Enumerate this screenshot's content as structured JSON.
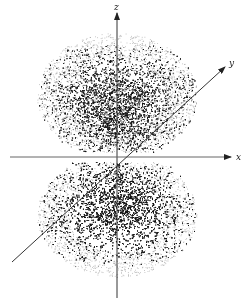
{
  "figure": {
    "axes": {
      "z": {
        "label": "z"
      },
      "y": {
        "label": "y"
      },
      "x": {
        "label": "x"
      }
    },
    "colors": {
      "background": "#ffffff",
      "axis": "#333333",
      "dots": "#111111"
    },
    "lobes": [
      {
        "name": "upper-lobe",
        "center": [
          117,
          95
        ],
        "rx": 80,
        "ry": 62
      },
      {
        "name": "lower-lobe",
        "center": [
          117,
          215
        ],
        "rx": 80,
        "ry": 62
      }
    ]
  }
}
